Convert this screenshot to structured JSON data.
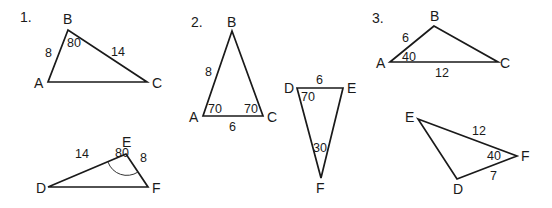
{
  "problems": [
    {
      "number": "1.",
      "triangle_top": {
        "vertices": {
          "A": "A",
          "B": "B",
          "C": "C"
        },
        "side_AB": "8",
        "side_BC": "14",
        "angle_B": "80"
      },
      "triangle_bottom": {
        "vertices": {
          "D": "D",
          "E": "E",
          "F": "F"
        },
        "side_DE": "14",
        "side_EF": "8",
        "angle_E": "80"
      }
    },
    {
      "number": "2.",
      "triangle_top": {
        "vertices": {
          "A": "A",
          "B": "B",
          "C": "C"
        },
        "side_AB": "8",
        "side_AC": "6",
        "angle_A": "70",
        "angle_C": "70"
      },
      "triangle_bottom": {
        "vertices": {
          "D": "D",
          "E": "E",
          "F": "F"
        },
        "side_DE": "6",
        "angle_D": "70",
        "angle_F": "30"
      }
    },
    {
      "number": "3.",
      "triangle_top": {
        "vertices": {
          "A": "A",
          "B": "B",
          "C": "C"
        },
        "side_AB": "6",
        "side_AC": "12",
        "angle_A": "40"
      },
      "triangle_bottom": {
        "vertices": {
          "D": "D",
          "E": "E",
          "F": "F"
        },
        "side_EF": "12",
        "side_DF": "7",
        "angle_F": "40"
      }
    }
  ]
}
